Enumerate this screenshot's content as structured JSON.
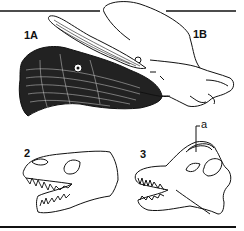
{
  "figure": {
    "labels": {
      "fig_1a": "1A",
      "fig_1b": "1B",
      "fig_2": "2",
      "fig_3": "3",
      "annotation_a": "a"
    },
    "colors": {
      "ink": "#111111",
      "background": "#ffffff"
    }
  }
}
